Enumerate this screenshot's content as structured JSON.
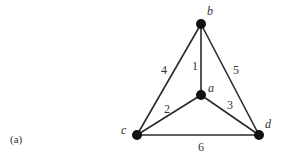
{
  "figure": {
    "caption": "(a)",
    "colors": {
      "edge": "#2a2a2a",
      "node": "#111111",
      "text": "#333333"
    },
    "nodes": {
      "a": {
        "label": "a"
      },
      "b": {
        "label": "b"
      },
      "c": {
        "label": "c"
      },
      "d": {
        "label": "d"
      }
    },
    "edges": [
      {
        "from": "b",
        "to": "a",
        "weight": "1"
      },
      {
        "from": "c",
        "to": "a",
        "weight": "2"
      },
      {
        "from": "a",
        "to": "d",
        "weight": "3"
      },
      {
        "from": "b",
        "to": "c",
        "weight": "4"
      },
      {
        "from": "b",
        "to": "d",
        "weight": "5"
      },
      {
        "from": "c",
        "to": "d",
        "weight": "6"
      }
    ]
  }
}
